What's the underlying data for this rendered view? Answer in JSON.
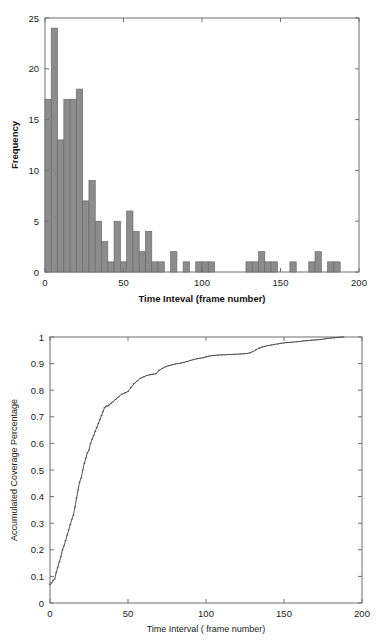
{
  "page": {
    "background": "#ffffff",
    "width": 388,
    "height": 640
  },
  "colors": {
    "bar_fill": "#8c8c8c",
    "bar_stroke": "#6a6a6a",
    "axis": "#6e6e6e",
    "curve": "#555555",
    "text": "#222222"
  },
  "chart_data": [
    {
      "id": "histogram",
      "type": "bar",
      "title": "",
      "xlabel": "Time Inteval (frame number)",
      "ylabel": "Frequency",
      "xlim": [
        0,
        200
      ],
      "ylim": [
        0,
        25
      ],
      "xticks": [
        0,
        50,
        100,
        150,
        200
      ],
      "xticklabels": [
        "0",
        "50",
        "100",
        "150",
        "200"
      ],
      "yticks": [
        0,
        5,
        10,
        15,
        20,
        25
      ],
      "yticklabels": [
        "0",
        "5",
        "10",
        "15",
        "20",
        "25"
      ],
      "grid": false,
      "legend": "none",
      "bin_width": 4,
      "bin_starts": [
        0,
        4,
        8,
        12,
        16,
        20,
        24,
        28,
        32,
        36,
        40,
        44,
        48,
        52,
        56,
        60,
        64,
        68,
        72,
        76,
        80,
        84,
        88,
        92,
        96,
        100,
        104,
        108,
        112,
        116,
        120,
        124,
        128,
        132,
        136,
        140,
        144,
        148,
        152,
        156,
        160,
        164,
        168,
        172,
        176,
        180,
        184,
        188
      ],
      "categories": [
        "0-4",
        "4-8",
        "8-12",
        "12-16",
        "16-20",
        "20-24",
        "24-28",
        "28-32",
        "32-36",
        "36-40",
        "40-44",
        "44-48",
        "48-52",
        "52-56",
        "56-60",
        "60-64",
        "64-68",
        "68-72",
        "72-76",
        "76-80",
        "80-84",
        "84-88",
        "88-92",
        "92-96",
        "96-100",
        "100-104",
        "104-108",
        "108-112",
        "112-116",
        "116-120",
        "120-124",
        "124-128",
        "128-132",
        "132-136",
        "136-140",
        "140-144",
        "144-148",
        "148-152",
        "152-156",
        "156-160",
        "160-164",
        "164-168",
        "168-172",
        "172-176",
        "176-180",
        "180-184",
        "184-188",
        "188-192"
      ],
      "values": [
        17,
        24,
        13,
        17,
        17,
        18,
        7,
        9,
        5,
        3,
        1,
        5,
        1,
        6,
        4,
        2,
        4,
        1,
        1,
        0,
        2,
        0,
        1,
        0,
        1,
        1,
        1,
        0,
        0,
        0,
        0,
        0,
        1,
        1,
        2,
        1,
        1,
        0,
        0,
        1,
        0,
        0,
        1,
        2,
        0,
        1,
        1,
        0
      ]
    },
    {
      "id": "cdf",
      "type": "line",
      "title": "",
      "xlabel": "Time Interval ( frame number)",
      "ylabel": "Accumulated Coverage Percentage",
      "xlim": [
        0,
        200
      ],
      "ylim": [
        0,
        1
      ],
      "xticks": [
        0,
        50,
        100,
        150,
        200
      ],
      "xticklabels": [
        "0",
        "50",
        "100",
        "150",
        "200"
      ],
      "yticks": [
        0,
        0.1,
        0.2,
        0.3,
        0.4,
        0.5,
        0.6,
        0.7,
        0.8,
        0.9,
        1
      ],
      "yticklabels": [
        "0",
        "0.1",
        "0.2",
        "0.3",
        "0.4",
        "0.5",
        "0.6",
        "0.7",
        "0.8",
        "0.9",
        "1"
      ],
      "grid": false,
      "legend": "none",
      "marker": "dot",
      "x": [
        0,
        1,
        2,
        3,
        4,
        5,
        6,
        7,
        8,
        9,
        10,
        11,
        12,
        13,
        14,
        15,
        16,
        17,
        18,
        19,
        20,
        21,
        22,
        23,
        24,
        25,
        26,
        27,
        28,
        29,
        30,
        31,
        32,
        33,
        34,
        35,
        36,
        37,
        38,
        39,
        40,
        42,
        44,
        46,
        48,
        50,
        52,
        54,
        56,
        58,
        60,
        62,
        64,
        66,
        68,
        70,
        72,
        74,
        76,
        78,
        80,
        82,
        84,
        86,
        88,
        90,
        92,
        94,
        96,
        98,
        100,
        102,
        104,
        106,
        108,
        110,
        112,
        114,
        116,
        118,
        120,
        122,
        124,
        126,
        128,
        130,
        132,
        134,
        136,
        138,
        140,
        142,
        144,
        146,
        148,
        150,
        152,
        154,
        156,
        158,
        160,
        162,
        164,
        166,
        168,
        170,
        172,
        174,
        176,
        178,
        180,
        182,
        184,
        186,
        188
      ],
      "y": [
        0.07,
        0.075,
        0.085,
        0.09,
        0.115,
        0.135,
        0.155,
        0.175,
        0.2,
        0.215,
        0.235,
        0.255,
        0.275,
        0.295,
        0.315,
        0.33,
        0.36,
        0.395,
        0.425,
        0.455,
        0.47,
        0.5,
        0.525,
        0.545,
        0.565,
        0.575,
        0.6,
        0.615,
        0.63,
        0.645,
        0.66,
        0.675,
        0.69,
        0.705,
        0.72,
        0.735,
        0.74,
        0.74,
        0.745,
        0.75,
        0.755,
        0.765,
        0.775,
        0.785,
        0.79,
        0.795,
        0.81,
        0.825,
        0.835,
        0.845,
        0.85,
        0.855,
        0.858,
        0.86,
        0.862,
        0.875,
        0.882,
        0.888,
        0.892,
        0.895,
        0.898,
        0.9,
        0.902,
        0.905,
        0.908,
        0.912,
        0.915,
        0.918,
        0.92,
        0.922,
        0.925,
        0.928,
        0.93,
        0.931,
        0.932,
        0.933,
        0.933,
        0.934,
        0.934,
        0.935,
        0.935,
        0.936,
        0.937,
        0.938,
        0.94,
        0.945,
        0.952,
        0.958,
        0.962,
        0.965,
        0.968,
        0.97,
        0.972,
        0.974,
        0.976,
        0.978,
        0.979,
        0.98,
        0.981,
        0.982,
        0.983,
        0.985,
        0.986,
        0.987,
        0.988,
        0.989,
        0.99,
        0.991,
        0.993,
        0.995,
        0.996,
        0.997,
        0.998,
        0.999,
        1.0
      ]
    }
  ]
}
